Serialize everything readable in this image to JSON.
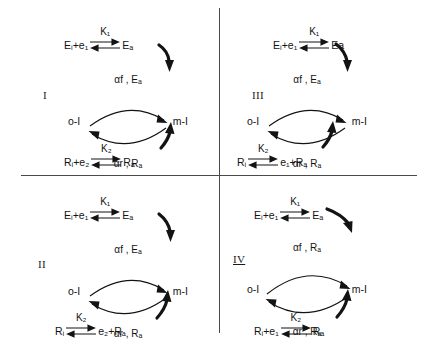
{
  "figure": {
    "quadrants": [
      {
        "id": "I",
        "label": "I",
        "top_reaction": {
          "lhs": "Eᵢ+e₁",
          "rate_constant": "K₁",
          "rhs": "Eₐ",
          "reversible": true
        },
        "bottom_reaction": {
          "lhs": "Rᵢ+e₂",
          "rate_constant": "K₂",
          "rhs": "Rₐ",
          "reversible": true
        },
        "cycle": {
          "left_node": "o-I",
          "right_node": "m-I",
          "forward_label": "αf , Eₐ",
          "reverse_label": "αr , Rₐ"
        }
      },
      {
        "id": "III",
        "label": "III",
        "top_reaction": {
          "lhs": "Eᵢ+e₁",
          "rate_constant": "K₁",
          "rhs": "Ea",
          "reversible": true
        },
        "bottom_reaction": {
          "lhs": "Rᵢ",
          "rate_constant": "K₂",
          "rhs": "e₁+Rₐ",
          "reversible": true
        },
        "cycle": {
          "left_node": "o-I",
          "right_node": "m-I",
          "forward_label": "αf , Eₐ",
          "reverse_label": "αr , Rₐ"
        }
      },
      {
        "id": "II",
        "label": "II",
        "top_reaction": {
          "lhs": "Eᵢ+e₁",
          "rate_constant": "K₁",
          "rhs": "Eₐ",
          "reversible": true
        },
        "bottom_reaction": {
          "lhs": "Rᵢ",
          "rate_constant": "K₂",
          "rhs": "e₂+Rₐ",
          "reversible": true
        },
        "cycle": {
          "left_node": "o-I",
          "right_node": "m-I",
          "forward_label": "αf , Eₐ",
          "reverse_label": "αr , Rₐ"
        }
      },
      {
        "id": "IV",
        "label": "IV",
        "top_reaction": {
          "lhs": "Eᵢ+e₁",
          "rate_constant": "K₁",
          "rhs": "Eₐ",
          "reversible": true
        },
        "bottom_reaction": {
          "lhs": "Rᵢ+e₁",
          "rate_constant": "K₂",
          "rhs": "Rₐ",
          "reversible": true
        },
        "cycle": {
          "left_node": "o-I",
          "right_node": "m-I",
          "forward_label": "αf , Rₐ",
          "reverse_label": "αr , Rₐ"
        }
      }
    ],
    "colors": {
      "ink": "#131313",
      "divider": "#4a4a4a",
      "background": "#ffffff"
    }
  }
}
